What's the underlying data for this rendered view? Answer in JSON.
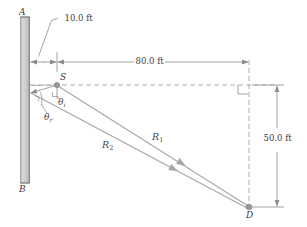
{
  "figure": {
    "background_color": "#ffffff",
    "line_color": "#8c8c8c",
    "wall_fill_color": "#c9c9c9",
    "wall_edge_color": "#707070",
    "point_color": "#9a9a9a",
    "text_color": "#2b2b2b"
  },
  "points": {
    "A": {
      "label": "A",
      "x": 18,
      "y": 14
    },
    "B": {
      "label": "B",
      "x": 18,
      "y": 186
    },
    "S": {
      "label": "S",
      "x": 57,
      "y": 84
    },
    "D": {
      "label": "D",
      "x": 249,
      "y": 207
    }
  },
  "dimensions": [
    {
      "name": "wall-to-source",
      "label": "10.0 ft",
      "value": 10.0,
      "unit": "ft"
    },
    {
      "name": "horizontal-run",
      "label": "80.0 ft",
      "value": 80.0,
      "unit": "ft"
    },
    {
      "name": "vertical-drop",
      "label": "50.0 ft",
      "value": 50.0,
      "unit": "ft"
    }
  ],
  "rays": [
    {
      "name": "ray-1",
      "label": "R",
      "subscript": "1"
    },
    {
      "name": "ray-2",
      "label": "R",
      "subscript": "2"
    }
  ],
  "angles": [
    {
      "name": "angle-incidence",
      "label": "θ",
      "subscript": "i"
    },
    {
      "name": "angle-reflection",
      "label": "θ",
      "subscript": "r"
    }
  ]
}
